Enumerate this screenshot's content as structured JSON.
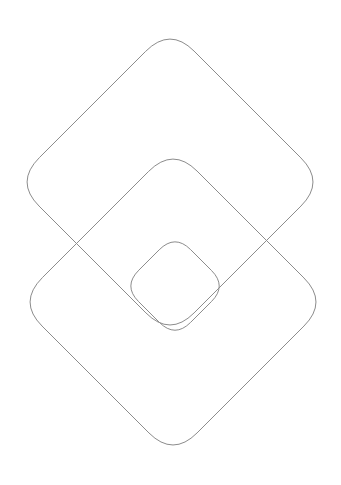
{
  "canvas": {
    "width": 341,
    "height": 485,
    "background_color": "#ffffff",
    "title": "Three overlapping rounded diamonds"
  },
  "style": {
    "stroke_color": "#8c8c8c",
    "stroke_width": 1,
    "fill": "none",
    "line_cap": "round",
    "line_join": "round"
  },
  "chart_data": {
    "type": "diagram",
    "shape_kind": "rounded-square-rotated-45",
    "units": "pixels",
    "origin": "top-left",
    "shapes": [
      {
        "id": "diamond-large",
        "label": "Large diamond",
        "center_x": 170,
        "center_y": 182,
        "half_diagonal": 155,
        "corner_radius": 34,
        "rotation_deg": 45,
        "apex_top": [
          170,
          27
        ],
        "apex_bottom": [
          170,
          337
        ],
        "apex_left": [
          21,
          185
        ],
        "apex_right": [
          320,
          185
        ]
      },
      {
        "id": "diamond-medium",
        "label": "Medium diamond",
        "center_x": 173,
        "center_y": 302,
        "half_diagonal": 155,
        "corner_radius": 34,
        "rotation_deg": 45,
        "apex_top": [
          173,
          144
        ],
        "apex_bottom": [
          177,
          456
        ],
        "apex_left": [
          21,
          305
        ],
        "apex_right": [
          320,
          305
        ]
      },
      {
        "id": "diamond-small",
        "label": "Small diamond",
        "center_x": 175,
        "center_y": 286,
        "half_diagonal": 52,
        "corner_radius": 22,
        "rotation_deg": 45,
        "apex_top": [
          175,
          236
        ],
        "apex_bottom": [
          175,
          336
        ],
        "apex_left": [
          119,
          287
        ],
        "apex_right": [
          231,
          287
        ]
      }
    ],
    "intersections": [
      [
        73,
        241
      ],
      [
        269,
        241
      ],
      [
        111,
        285
      ],
      [
        236,
        285
      ]
    ],
    "grid": false,
    "legend": null,
    "xlabel": "",
    "ylabel": ""
  }
}
